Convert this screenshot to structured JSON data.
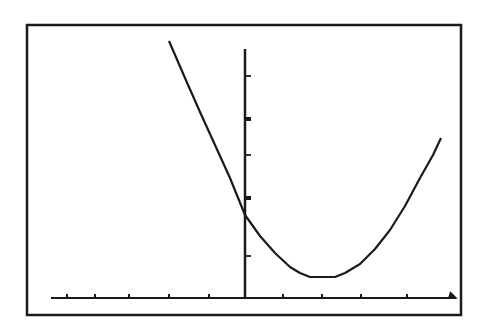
{
  "chart_data": {
    "type": "line",
    "title": "",
    "xlabel": "",
    "ylabel": "",
    "grid": false,
    "legend": null,
    "x_ticks_count_left": 5,
    "x_ticks_count_right": 5,
    "y_ticks_count": 5,
    "series": [
      {
        "name": "parabola",
        "points_px": [
          [
            169,
            41
          ],
          [
            185,
            78
          ],
          [
            200,
            112
          ],
          [
            215,
            145
          ],
          [
            230,
            178
          ],
          [
            245,
            215
          ],
          [
            260,
            236
          ],
          [
            275,
            253
          ],
          [
            290,
            267
          ],
          [
            300,
            273
          ],
          [
            310,
            277
          ],
          [
            335,
            277
          ],
          [
            345,
            273
          ],
          [
            360,
            264
          ],
          [
            375,
            249
          ],
          [
            390,
            230
          ],
          [
            405,
            206
          ],
          [
            420,
            178
          ],
          [
            433,
            155
          ],
          [
            441,
            138
          ]
        ]
      }
    ],
    "axes_px": {
      "frame": [
        27,
        25,
        461,
        315
      ],
      "x_axis_y": 298,
      "x_axis_range": [
        51,
        456
      ],
      "y_axis_x": 245,
      "y_axis_range": [
        49,
        298
      ],
      "x_ticks": [
        67,
        95,
        129,
        169,
        209,
        283,
        322,
        361,
        407
      ],
      "y_ticks": [
        76,
        119,
        155,
        198,
        256
      ],
      "y_ticks_bold": [
        119,
        198
      ]
    },
    "colors": {
      "ink": "#1a1a1a",
      "background": "#ffffff"
    }
  }
}
